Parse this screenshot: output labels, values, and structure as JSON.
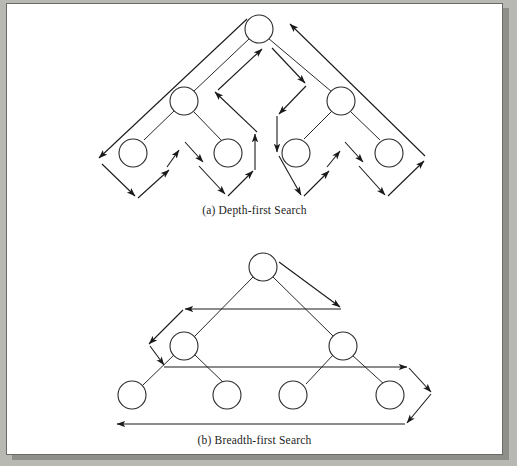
{
  "page": {
    "background_color": "#b9b9b4",
    "paper_color": "#ffffff",
    "border_color": "#6a6a66",
    "ink_color": "#1c1c1c"
  },
  "figures": [
    {
      "id": "depth-first",
      "caption": "(a) Depth-first Search",
      "description": "Binary tree of depth three traversed in depth-first (pre-order) order, with directed arrows tracing the zig-zag walk around the tree",
      "tree": {
        "radius": 14,
        "nodes": [
          {
            "id": "root",
            "cx": 258,
            "cy": 28
          },
          {
            "id": "L",
            "cx": 183,
            "cy": 100
          },
          {
            "id": "R",
            "cx": 340,
            "cy": 100
          },
          {
            "id": "LL",
            "cx": 132,
            "cy": 152
          },
          {
            "id": "LR",
            "cx": 227,
            "cy": 152
          },
          {
            "id": "RL",
            "cx": 295,
            "cy": 152
          },
          {
            "id": "RR",
            "cx": 388,
            "cy": 152
          }
        ],
        "edges": [
          [
            "root",
            "L"
          ],
          [
            "root",
            "R"
          ],
          [
            "L",
            "LL"
          ],
          [
            "L",
            "LR"
          ],
          [
            "R",
            "RL"
          ],
          [
            "R",
            "RR"
          ]
        ]
      }
    },
    {
      "id": "breadth-first",
      "caption": "(b) Breadth-first Search",
      "description": "Binary tree of depth three traversed in breadth-first (level order) order, with long horizontal arrows sweeping each level right-to-left",
      "tree": {
        "radius": 14,
        "nodes": [
          {
            "id": "root",
            "cx": 262,
            "cy": 266
          },
          {
            "id": "L",
            "cx": 183,
            "cy": 345
          },
          {
            "id": "R",
            "cx": 342,
            "cy": 345
          },
          {
            "id": "LL",
            "cx": 131,
            "cy": 394
          },
          {
            "id": "LR",
            "cx": 226,
            "cy": 394
          },
          {
            "id": "RL",
            "cx": 292,
            "cy": 394
          },
          {
            "id": "RR",
            "cx": 389,
            "cy": 394
          }
        ],
        "edges": [
          [
            "root",
            "L"
          ],
          [
            "root",
            "R"
          ],
          [
            "L",
            "LL"
          ],
          [
            "L",
            "LR"
          ],
          [
            "R",
            "RL"
          ],
          [
            "R",
            "RR"
          ]
        ]
      }
    }
  ]
}
